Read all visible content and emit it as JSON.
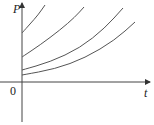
{
  "chart_data": {
    "type": "line",
    "title": "",
    "xlabel": "t",
    "ylabel": "P",
    "origin_label": "0",
    "grid": false,
    "legend": null,
    "series": [
      {
        "name": "curve-1",
        "p0_px": 33,
        "points": [
          [
            22,
            33
          ],
          [
            30,
            24
          ],
          [
            38,
            15
          ],
          [
            45,
            5
          ]
        ]
      },
      {
        "name": "curve-2",
        "p0_px": 57,
        "points": [
          [
            22,
            57
          ],
          [
            40,
            45
          ],
          [
            60,
            30
          ],
          [
            75,
            17
          ],
          [
            84,
            7
          ]
        ]
      },
      {
        "name": "curve-3",
        "p0_px": 70,
        "points": [
          [
            22,
            70
          ],
          [
            50,
            62
          ],
          [
            80,
            48
          ],
          [
            105,
            28
          ],
          [
            123,
            8
          ]
        ]
      },
      {
        "name": "curve-4",
        "p0_px": 75,
        "points": [
          [
            22,
            75
          ],
          [
            55,
            69
          ],
          [
            85,
            58
          ],
          [
            115,
            40
          ],
          [
            135,
            22
          ]
        ]
      }
    ],
    "colors": {
      "axis": "#333333",
      "curve": "#555555"
    }
  },
  "labels": {
    "y_axis": "P",
    "x_axis": "t",
    "origin": "0"
  }
}
